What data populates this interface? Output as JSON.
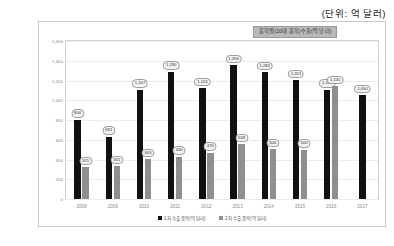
{
  "unit_note": "(단위: 억 달러)",
  "chart_data": {
    "type": "bar",
    "title": "품목별(10대 품목)수출(억 달러)",
    "xlabel": "",
    "ylabel": "",
    "ylim": [
      0,
      1600
    ],
    "grid": true,
    "legend_position": "bottom",
    "yticks": [
      0,
      200,
      400,
      600,
      800,
      1000,
      1200,
      1400,
      1600
    ],
    "ytick_labels": [
      "0",
      "200",
      "400",
      "600",
      "800",
      "1,000",
      "1,200",
      "1,400",
      "1,600"
    ],
    "categories": [
      "2008",
      "2009",
      "2010",
      "2011",
      "2012",
      "2013",
      "2014",
      "2015",
      "2016",
      "2017"
    ],
    "series": [
      {
        "name": "1차 수출 품목(억 달러)",
        "color": "#111111",
        "values": [
          804,
          631,
          1107,
          1290,
          1124,
          1356,
          1282,
          1201,
          1109,
          1050
        ],
        "labels": [
          "804",
          "631",
          "1,107",
          "1,290",
          "1,124",
          "1,356",
          "1,282",
          "1,201",
          "1,109",
          "1,050"
        ]
      },
      {
        "name": "2차 수출 품목(억 달러)",
        "color": "#8f8f8f",
        "values": [
          321,
          331,
          405,
          430,
          470,
          558,
          506,
          500,
          1141,
          null
        ],
        "labels": [
          "321",
          "331",
          "405",
          "430",
          "470",
          "558",
          "506",
          "500",
          "1,141",
          ""
        ]
      }
    ]
  }
}
